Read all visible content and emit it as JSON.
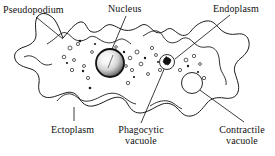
{
  "figure": {
    "width": 275,
    "height": 156,
    "background_color": "#ffffff",
    "line_color": "#1a1a1a",
    "text_color": "#111111"
  },
  "labels": {
    "pseudopodium": "Pseudopodium",
    "nucleus": "Nucleus",
    "endoplasm": "Endoplasm",
    "ectoplasm": "Ectoplasm",
    "phagocytic_line1": "Phagocytic",
    "phagocytic_line2": "vacuole",
    "contractile_line1": "Contractile",
    "contractile_line2": "vacuole"
  },
  "structures": {
    "nucleus": {
      "name": "nucleus",
      "cx": 110,
      "cy": 63,
      "r": 14,
      "style": "shaded-sphere",
      "ring_color": "#1a1a1a",
      "fill_light": "#ffffff",
      "fill_dark": "#555555"
    },
    "phagocytic_vacuole": {
      "name": "phagocytic-vacuole",
      "cx": 167,
      "cy": 62,
      "r": 7.5,
      "contains": "engulfed-food-particle",
      "particle_color": "#111111"
    },
    "contractile_vacuole": {
      "name": "contractile-vacuole",
      "cx": 192,
      "cy": 83,
      "r": 10.5,
      "fill": "none"
    }
  },
  "granules": {
    "open_circles": [
      [
        70,
        48,
        2.0
      ],
      [
        78,
        44,
        1.6
      ],
      [
        64,
        57,
        1.8
      ],
      [
        74,
        60,
        1.5
      ],
      [
        72,
        70,
        1.7
      ],
      [
        84,
        66,
        1.5
      ],
      [
        92,
        52,
        1.4
      ],
      [
        88,
        78,
        1.6
      ],
      [
        130,
        58,
        1.8
      ],
      [
        137,
        52,
        2.0
      ],
      [
        141,
        64,
        1.9
      ],
      [
        132,
        70,
        1.6
      ],
      [
        126,
        66,
        1.4
      ],
      [
        128,
        83,
        1.7
      ],
      [
        148,
        74,
        1.5
      ],
      [
        152,
        48,
        1.6
      ],
      [
        156,
        55,
        1.5
      ],
      [
        160,
        70,
        1.6
      ],
      [
        186,
        60,
        1.9
      ],
      [
        194,
        56,
        1.7
      ],
      [
        180,
        70,
        1.6
      ],
      [
        204,
        78,
        1.7
      ],
      [
        200,
        64,
        1.4
      ],
      [
        116,
        47,
        1.3
      ]
    ],
    "filled_dots": [
      [
        80,
        41,
        1.3
      ],
      [
        67,
        63,
        1.1
      ],
      [
        83,
        71,
        1.2
      ],
      [
        90,
        88,
        1.3
      ],
      [
        95,
        44,
        1.1
      ],
      [
        124,
        52,
        1.2
      ],
      [
        134,
        77,
        1.1
      ],
      [
        145,
        58,
        1.2
      ],
      [
        188,
        66,
        1.2
      ],
      [
        198,
        72,
        1.1
      ],
      [
        119,
        57,
        1.0
      ],
      [
        158,
        62,
        1.0
      ]
    ]
  },
  "leaders": {
    "pseudopodium": "M 36,17 L 62,38",
    "nucleus": "M 126,16 L 108,60",
    "endoplasm": "M 229,15 L 176,58",
    "ectoplasm": "M 74,120 L 74,108",
    "phagocytic": "M 141,122 L 166,66",
    "contractile": "M 243,122 L 196,87"
  }
}
